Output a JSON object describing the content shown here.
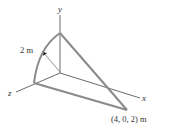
{
  "diagram": {
    "axes": {
      "x_label": "x",
      "y_label": "y",
      "z_label": "z"
    },
    "radius_label": "2 m",
    "point_label": "(4, 0, 2) m",
    "colors": {
      "thick_line": "#8a8a8a",
      "thin_line": "#444444",
      "text": "#333333",
      "background": "#ffffff"
    }
  }
}
